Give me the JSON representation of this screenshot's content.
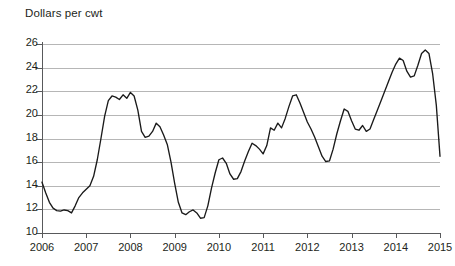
{
  "chart_data": {
    "type": "line",
    "title": "Dollars per cwt",
    "xlabel": "",
    "ylabel": "Dollars per cwt",
    "ylim": [
      10,
      26
    ],
    "xlim": [
      2006,
      2015
    ],
    "grid": true,
    "legend": null,
    "y_ticks": [
      10,
      12,
      14,
      16,
      18,
      20,
      22,
      24,
      26
    ],
    "x_ticks": [
      2006,
      2007,
      2008,
      2009,
      2010,
      2011,
      2012,
      2013,
      2014,
      2015
    ],
    "x_tick_labels": [
      "2006",
      "2007",
      "2008",
      "2009",
      "2010",
      "2011",
      "2012",
      "2013",
      "2014",
      "2015"
    ],
    "y_tick_labels": [
      "10",
      "12",
      "14",
      "16",
      "18",
      "20",
      "22",
      "24",
      "26"
    ],
    "line_color": "#1a1a1a",
    "grid_color": "#a9a9a9",
    "axis_color": "#58595b",
    "series": [
      {
        "name": "All milk price",
        "x": [
          2006.0,
          2006.083,
          2006.167,
          2006.25,
          2006.333,
          2006.417,
          2006.5,
          2006.583,
          2006.667,
          2006.75,
          2006.833,
          2006.917,
          2007.0,
          2007.083,
          2007.167,
          2007.25,
          2007.333,
          2007.417,
          2007.5,
          2007.583,
          2007.667,
          2007.75,
          2007.833,
          2007.917,
          2008.0,
          2008.083,
          2008.167,
          2008.25,
          2008.333,
          2008.417,
          2008.5,
          2008.583,
          2008.667,
          2008.75,
          2008.833,
          2008.917,
          2009.0,
          2009.083,
          2009.167,
          2009.25,
          2009.333,
          2009.417,
          2009.5,
          2009.583,
          2009.667,
          2009.75,
          2009.833,
          2009.917,
          2010.0,
          2010.083,
          2010.167,
          2010.25,
          2010.333,
          2010.417,
          2010.5,
          2010.583,
          2010.667,
          2010.75,
          2010.833,
          2010.917,
          2011.0,
          2011.083,
          2011.167,
          2011.25,
          2011.333,
          2011.417,
          2011.5,
          2011.583,
          2011.667,
          2011.75,
          2011.833,
          2011.917,
          2012.0,
          2012.083,
          2012.167,
          2012.25,
          2012.333,
          2012.417,
          2012.5,
          2012.583,
          2012.667,
          2012.75,
          2012.833,
          2012.917,
          2013.0,
          2013.083,
          2013.167,
          2013.25,
          2013.333,
          2013.417,
          2013.5,
          2013.583,
          2013.667,
          2013.75,
          2013.833,
          2013.917,
          2014.0,
          2014.083,
          2014.167,
          2014.25,
          2014.333,
          2014.417,
          2014.5,
          2014.583,
          2014.667,
          2014.75,
          2014.833,
          2014.917,
          2015.0
        ],
        "values": [
          14.3,
          13.4,
          12.6,
          12.1,
          11.9,
          11.85,
          11.95,
          11.9,
          11.7,
          12.3,
          13.0,
          13.4,
          13.7,
          14.0,
          14.8,
          16.2,
          18.0,
          19.9,
          21.2,
          21.6,
          21.5,
          21.3,
          21.7,
          21.4,
          21.9,
          21.6,
          20.4,
          18.6,
          18.1,
          18.2,
          18.6,
          19.3,
          19.0,
          18.3,
          17.5,
          16.0,
          14.2,
          12.6,
          11.7,
          11.55,
          11.8,
          11.95,
          11.7,
          11.25,
          11.3,
          12.3,
          13.8,
          15.1,
          16.2,
          16.35,
          15.9,
          15.0,
          14.55,
          14.6,
          15.2,
          16.1,
          16.9,
          17.6,
          17.4,
          17.1,
          16.7,
          17.4,
          18.9,
          18.7,
          19.3,
          18.9,
          19.7,
          20.7,
          21.6,
          21.7,
          21.0,
          20.2,
          19.4,
          18.8,
          18.1,
          17.3,
          16.5,
          16.05,
          16.1,
          17.1,
          18.4,
          19.5,
          20.5,
          20.3,
          19.5,
          18.8,
          18.7,
          19.1,
          18.6,
          18.8,
          19.6,
          20.4,
          21.2,
          22.0,
          22.8,
          23.6,
          24.3,
          24.8,
          24.6,
          23.7,
          23.2,
          23.3,
          24.2,
          25.2,
          25.5,
          25.2,
          23.5,
          20.8,
          16.5
        ]
      }
    ]
  }
}
